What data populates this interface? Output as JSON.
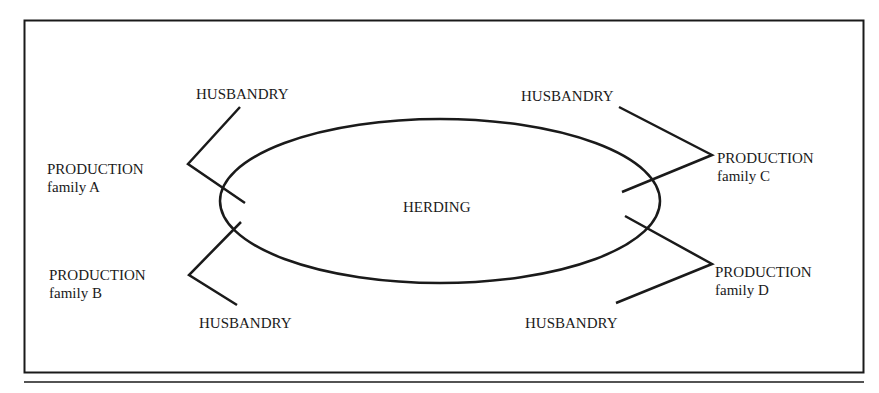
{
  "diagram": {
    "center": {
      "label": "HERDING"
    },
    "families": [
      {
        "production": "PRODUCTION",
        "family": "family A",
        "husbandry": "HUSBANDRY"
      },
      {
        "production": "PRODUCTION",
        "family": "family B",
        "husbandry": "HUSBANDRY"
      },
      {
        "production": "PRODUCTION",
        "family": "family C",
        "husbandry": "HUSBANDRY"
      },
      {
        "production": "PRODUCTION",
        "family": "family D",
        "husbandry": "HUSBANDRY"
      }
    ],
    "colors": {
      "line": "#1a1a1a",
      "background": "#ffffff"
    }
  }
}
